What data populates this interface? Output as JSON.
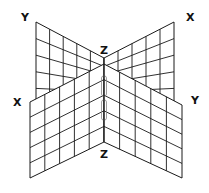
{
  "diagram": {
    "labels": {
      "back_left": "Y",
      "back_right": "X",
      "top_center": "Z",
      "front_left": "X",
      "front_right": "Y",
      "bottom_center": "Z"
    },
    "line_color": "#1a1a1a",
    "background": "#ffffff",
    "grid": {
      "back_left_plane": {
        "cols": 5,
        "rows": 5
      },
      "back_right_plane": {
        "cols": 5,
        "rows": 5
      },
      "front_left_plane": {
        "cols": 5,
        "rows": 5
      },
      "front_right_plane": {
        "cols": 5,
        "rows": 5
      }
    }
  }
}
